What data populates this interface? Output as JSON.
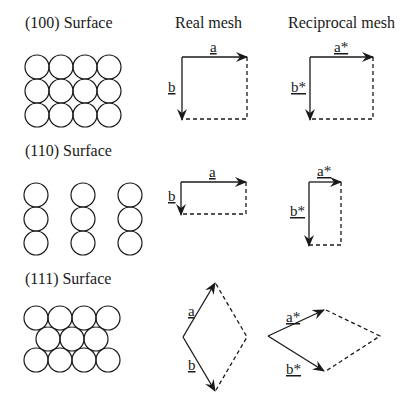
{
  "headers": {
    "col_real": "Real mesh",
    "col_reciprocal": "Reciprocal mesh"
  },
  "rows": [
    {
      "surface": "(100) Surface",
      "real": {
        "a": "a",
        "b": "b"
      },
      "reciprocal": {
        "a": "a*",
        "b": "b*"
      }
    },
    {
      "surface": "(110) Surface",
      "real": {
        "a": "a",
        "b": "b"
      },
      "reciprocal": {
        "a": "a*",
        "b": "b*"
      }
    },
    {
      "surface": "(111) Surface",
      "real": {
        "a": "a",
        "b": "b"
      },
      "reciprocal": {
        "a": "a*",
        "b": "b*"
      }
    }
  ],
  "colors": {
    "line": "#1a1a1a",
    "background": "#ffffff"
  }
}
